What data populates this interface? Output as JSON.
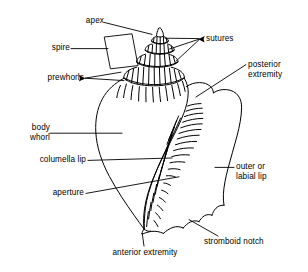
{
  "diagram": {
    "background_color": "#ffffff",
    "line_color": "#000000",
    "labels": [
      {
        "id": "apex",
        "text": "apex",
        "side": "left"
      },
      {
        "id": "spire",
        "text": "spire",
        "side": "left"
      },
      {
        "id": "prewhorls",
        "text": "prewhorls",
        "side": "left"
      },
      {
        "id": "body-whorl-line1",
        "text": "body",
        "side": "left"
      },
      {
        "id": "body-whorl-line2",
        "text": "whorl",
        "side": "left"
      },
      {
        "id": "columella-lip",
        "text": "columella lip",
        "side": "left"
      },
      {
        "id": "aperture",
        "text": "aperture",
        "side": "left"
      },
      {
        "id": "sutures",
        "text": "sutures",
        "side": "right"
      },
      {
        "id": "posterior-line1",
        "text": "posterior",
        "side": "right"
      },
      {
        "id": "posterior-line2",
        "text": "extremity",
        "side": "right"
      },
      {
        "id": "outer-lip-line1",
        "text": "outer or",
        "side": "right"
      },
      {
        "id": "outer-lip-line2",
        "text": "labial lip",
        "side": "right"
      },
      {
        "id": "stromboid-notch",
        "text": "stromboid notch",
        "side": "right"
      },
      {
        "id": "anterior-extremity",
        "text": "anterior extremity",
        "side": "bottom"
      }
    ]
  }
}
